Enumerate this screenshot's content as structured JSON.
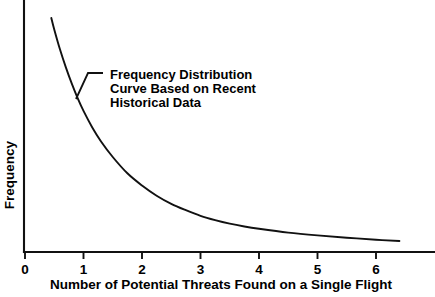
{
  "chart_data": {
    "type": "line",
    "title": "",
    "subtitle": "",
    "xlabel": "Number of Potential Threats Found on a Single Flight",
    "ylabel": "Frequency",
    "xlim": [
      0,
      7
    ],
    "ylim": [
      0,
      1
    ],
    "grid": false,
    "legend": null,
    "x_ticks": [
      "0",
      "1",
      "2",
      "3",
      "4",
      "5",
      "6"
    ],
    "x_tick_values": [
      0,
      1,
      2,
      3,
      4,
      5,
      6
    ],
    "y_ticks": [],
    "y_tick_values": [],
    "series": [
      {
        "name": "Frequency Distribution Curve Based on Recent Historical Data",
        "x": [
          0.45,
          0.5,
          0.6,
          0.7,
          0.8,
          0.9,
          1.0,
          1.15,
          1.3,
          1.5,
          1.75,
          2.0,
          2.25,
          2.5,
          2.75,
          3.0,
          3.25,
          3.5,
          3.75,
          4.0,
          4.5,
          5.0,
          5.5,
          6.0,
          6.4
        ],
        "y": [
          0.93,
          0.885,
          0.805,
          0.735,
          0.672,
          0.615,
          0.565,
          0.5,
          0.445,
          0.384,
          0.32,
          0.272,
          0.232,
          0.2,
          0.175,
          0.153,
          0.136,
          0.122,
          0.111,
          0.102,
          0.087,
          0.076,
          0.067,
          0.059,
          0.054
        ]
      }
    ],
    "annotations": [
      {
        "name": "curve-callout",
        "lines": [
          "Frequency Distribution",
          "Curve Based on Recent",
          "Historical Data"
        ],
        "attaches_to_x": 0.88,
        "attaches_to_y": 0.625
      }
    ]
  },
  "geometry": {
    "axis_origin_x": 24,
    "axis_origin_y": 252,
    "axis_top_y": 0,
    "axis_right_x": 435,
    "tick_zero_x": 25,
    "tick_spacing_px": 58.5,
    "tick_length_px": 7,
    "curve_start_px": [
      51,
      18
    ],
    "curve_end_px": [
      400,
      241
    ],
    "leader_points_px": [
      [
        76,
        99
      ],
      [
        88,
        73
      ],
      [
        103,
        73
      ]
    ],
    "annotation_text_x": 110,
    "annotation_line1_baseline_y": 79,
    "annotation_line_height": 14,
    "xlabel_center_x": 221,
    "xlabel_baseline_y": 289,
    "ylabel_center_y": 175,
    "ylabel_x": 14
  },
  "colors": {
    "background": "#ffffff",
    "ink": "#111111",
    "text": "#000000"
  }
}
